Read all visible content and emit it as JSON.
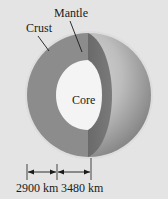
{
  "diagram": {
    "labels": {
      "mantle": "Mantle",
      "crust": "Crust",
      "core": "Core"
    },
    "dimensions": [
      {
        "label": "2900 km",
        "from_x": 27,
        "to_x": 57
      },
      {
        "label": "3480 km",
        "from_x": 57,
        "to_x": 91
      }
    ],
    "colors": {
      "background": "#e4e4e4",
      "mantle_cut": "#8c8c8c",
      "mantle_edge_face": "#6f6f6f",
      "core": "#f4f4f4",
      "sphere_light": "#d8d8d8",
      "sphere_dark": "#8a8a8a",
      "line": "#1a1a1a"
    }
  }
}
